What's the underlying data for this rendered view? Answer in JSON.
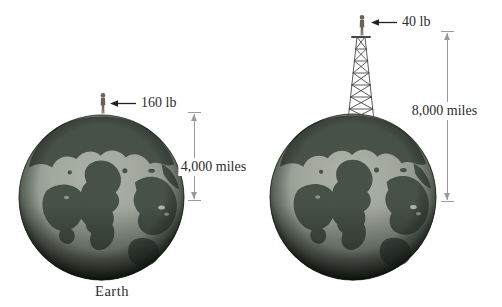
{
  "figure": {
    "caption": "Earth",
    "left_globe": {
      "weight_label": "160 lb",
      "distance_label": "4,000 miles"
    },
    "right_globe": {
      "weight_label": "40 lb",
      "distance_label": "8,000 miles"
    },
    "colors": {
      "ocean": "#a2a89e",
      "land": "#475148",
      "limb_shadow": "#1f2a20",
      "label_text": "#2d2d2d",
      "dimension_gray": "#9b9b9b",
      "arrow_black": "#222222",
      "person_figure": "#6a6055"
    },
    "icons": {
      "globe": "earth-globe",
      "person": "person-icon",
      "tower": "lattice-tower-icon",
      "weight_arrow": "arrow-left-icon",
      "dimension": "vertical-dimension-arrows"
    }
  }
}
